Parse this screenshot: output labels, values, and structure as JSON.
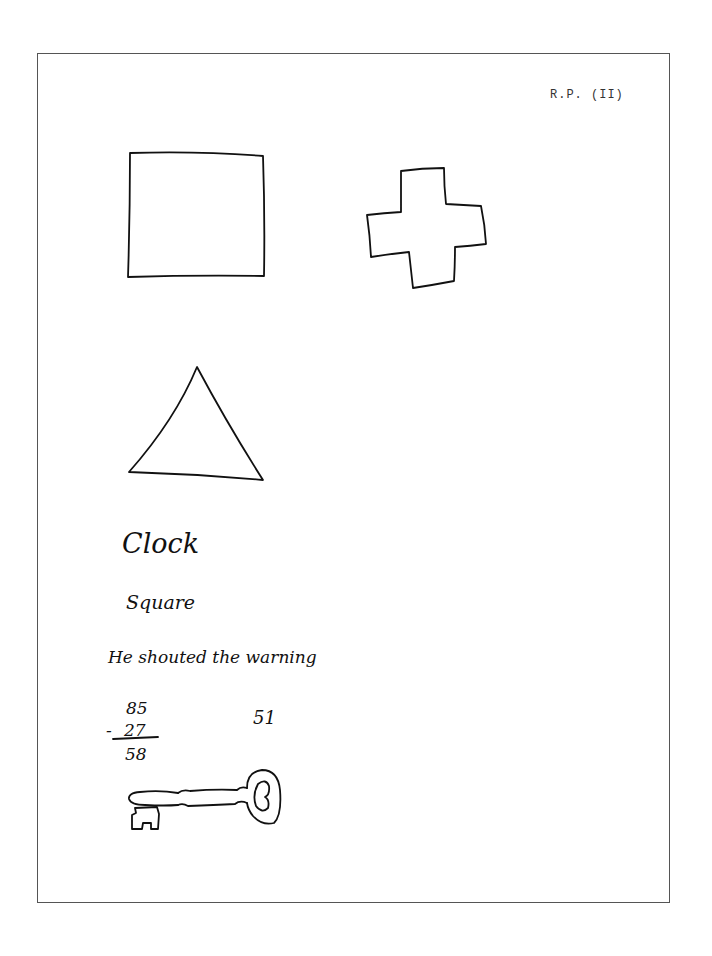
{
  "header": {
    "label": "R.P. (II)"
  },
  "drawings": {
    "shapes": [
      {
        "name": "square",
        "description": "hand-drawn square"
      },
      {
        "name": "cross",
        "description": "hand-drawn plus/cross shape"
      },
      {
        "name": "triangle",
        "description": "hand-drawn triangle"
      },
      {
        "name": "key",
        "description": "hand-drawn skeleton key"
      }
    ]
  },
  "handwriting": {
    "word1": "Clock",
    "word2": "Square",
    "sentence": "He shouted the warning",
    "arithmetic": {
      "top": "85",
      "operator": "-",
      "bottom": "27",
      "result": "58"
    },
    "side_number": "51"
  },
  "colors": {
    "ink": "#111111",
    "border": "#555555",
    "paper": "#ffffff"
  }
}
